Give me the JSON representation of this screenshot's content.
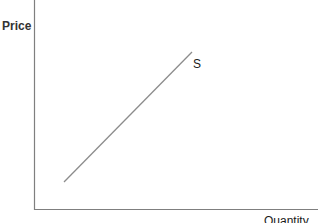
{
  "diagram": {
    "type": "supply-curve",
    "y_axis_label": "Price",
    "x_axis_label": "Quantity",
    "curves": [
      {
        "name": "S",
        "label": "S",
        "direction": "upward-sloping"
      }
    ]
  },
  "colors": {
    "axis": "#7f7f7f",
    "curve": "#8c8c8c",
    "text": "#1a1a1a"
  }
}
